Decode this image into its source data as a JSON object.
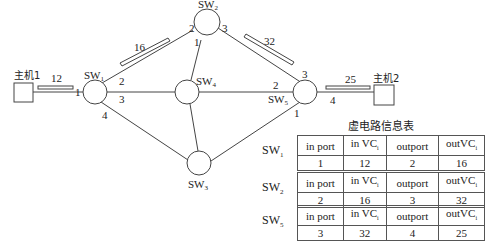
{
  "hosts": [
    {
      "id": "host1",
      "label": "主机1"
    },
    {
      "id": "host2",
      "label": "主机2"
    }
  ],
  "switches": [
    {
      "id": "sw1",
      "base": "SW",
      "sub": "1"
    },
    {
      "id": "sw2",
      "base": "SW",
      "sub": "2"
    },
    {
      "id": "sw3",
      "base": "SW",
      "sub": "3"
    },
    {
      "id": "sw4",
      "base": "SW",
      "sub": "4"
    },
    {
      "id": "sw5",
      "base": "SW",
      "sub": "5"
    }
  ],
  "ports": {
    "sw1": {
      "to_host1": "1",
      "to_sw2": "2",
      "to_sw4": "3",
      "to_sw3": "4"
    },
    "sw2": {
      "to_sw1": "2",
      "to_sw4": "1",
      "to_sw5": "3"
    },
    "sw5": {
      "to_sw2": "3",
      "to_sw4": "2",
      "to_sw3": "1",
      "to_host2": "4"
    }
  },
  "vc_labels": {
    "host1_sw1": "12",
    "sw1_sw2": "16",
    "sw2_sw5": "32",
    "sw5_host2": "25"
  },
  "table_title": "虚电路信息表",
  "tables": [
    {
      "switch": {
        "base": "SW",
        "sub": "1"
      },
      "headers": [
        {
          "text": "in port",
          "sub": ""
        },
        {
          "text": "in VC",
          "sub": "i"
        },
        {
          "text": "outport",
          "sub": ""
        },
        {
          "text": "outVC",
          "sub": "i"
        }
      ],
      "row": [
        "1",
        "12",
        "2",
        "16"
      ]
    },
    {
      "switch": {
        "base": "SW",
        "sub": "2"
      },
      "headers": [
        {
          "text": "in port",
          "sub": ""
        },
        {
          "text": "in VC",
          "sub": "i"
        },
        {
          "text": "outport",
          "sub": ""
        },
        {
          "text": "outVC",
          "sub": "i"
        }
      ],
      "row": [
        "2",
        "16",
        "3",
        "32"
      ]
    },
    {
      "switch": {
        "base": "SW",
        "sub": "5"
      },
      "headers": [
        {
          "text": "in port",
          "sub": ""
        },
        {
          "text": "in VC",
          "sub": "i"
        },
        {
          "text": "outport",
          "sub": ""
        },
        {
          "text": "outVC",
          "sub": "i"
        }
      ],
      "row": [
        "3",
        "32",
        "4",
        "25"
      ]
    }
  ]
}
